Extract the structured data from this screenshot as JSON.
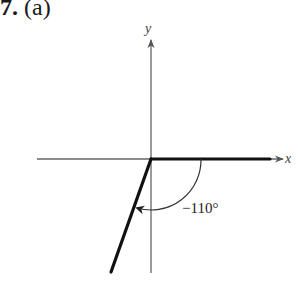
{
  "problem": {
    "number": "7.",
    "part": "(a)"
  },
  "figure": {
    "x_axis_label": "x",
    "y_axis_label": "y",
    "angle_label": "−110°",
    "angle_degrees": -110,
    "initial_side": "positive x-axis",
    "terminal_side_quadrant": "III",
    "rotation_direction": "clockwise",
    "colors": {
      "axes": "#666666",
      "rays": "#111111",
      "arc": "#333333"
    }
  }
}
